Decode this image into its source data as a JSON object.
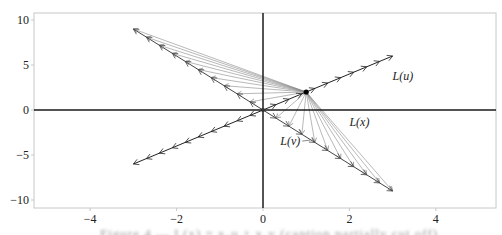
{
  "chart_data": {
    "type": "line",
    "title": "",
    "xlabel": "",
    "ylabel": "",
    "xlim": [
      -5.3,
      5.5
    ],
    "ylim": [
      -11,
      10.6
    ],
    "grid": false,
    "x_ticks": [
      -4,
      -2,
      0,
      2,
      4
    ],
    "x_tick_labels": [
      "−4",
      "−2",
      "0",
      "2",
      "4"
    ],
    "y_ticks": [
      10,
      5,
      0,
      -5,
      -10
    ],
    "y_tick_labels": [
      "10",
      "5",
      "0",
      "−5",
      "−10"
    ],
    "point_x": [
      1,
      2
    ],
    "series": [
      {
        "name": "L(u)",
        "type": "arrow-line",
        "from": [
          0,
          0
        ],
        "to": [
          3,
          6
        ],
        "arrow_count": 10,
        "color": "#222222"
      },
      {
        "name": "L(v)",
        "type": "arrow-line",
        "from": [
          0,
          0
        ],
        "to": [
          3,
          -9
        ],
        "arrow_count": 10,
        "color": "#444444"
      },
      {
        "name": "upper-left ray",
        "type": "arrow-line",
        "from": [
          0,
          0
        ],
        "to": [
          -3,
          9
        ],
        "arrow_count": 10,
        "color": "#444444"
      },
      {
        "name": "lower-left ray",
        "type": "arrow-line",
        "from": [
          0,
          0
        ],
        "to": [
          -3,
          -6
        ],
        "arrow_count": 10,
        "color": "#222222"
      },
      {
        "name": "L(x) fan to L(v)",
        "type": "fan",
        "origin": [
          1,
          2
        ],
        "target_dir": [
          3,
          -9
        ],
        "t_values": [
          0.1,
          0.2,
          0.3,
          0.4,
          0.5,
          0.6,
          0.7,
          0.8,
          0.9,
          1.0
        ],
        "color": "#888888"
      },
      {
        "name": "fan to upper-left ray",
        "type": "fan",
        "origin": [
          1,
          2
        ],
        "target_dir": [
          -3,
          9
        ],
        "t_values": [
          0.1,
          0.2,
          0.3,
          0.4,
          0.5,
          0.6,
          0.7,
          0.8,
          0.9,
          1.0
        ],
        "color": "#888888"
      }
    ],
    "annotations": [
      {
        "text": "L(u)",
        "x": 3.0,
        "y": 3.3
      },
      {
        "text": "L(x)",
        "x": 2.0,
        "y": -1.8
      },
      {
        "text": "L(v)",
        "x": 0.4,
        "y": -3.9
      }
    ]
  },
  "caption": "Figure 4 — L(x) = x₁u + x₂v (caption partially cut off)",
  "colors": {
    "axis": "#1a1a1a",
    "frame": "#c8c8c8",
    "dark_line": "#222222",
    "fan_line": "#8a8a8a",
    "point": "#000000"
  }
}
